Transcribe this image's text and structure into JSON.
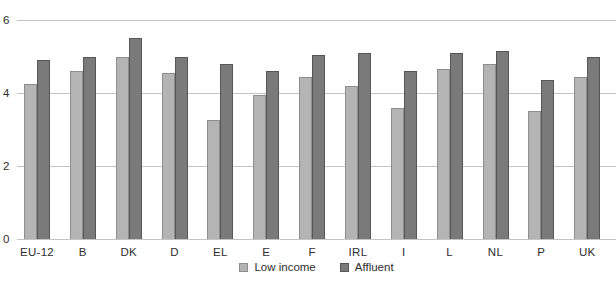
{
  "chart_data": {
    "type": "bar",
    "title": "",
    "xlabel": "",
    "ylabel": "",
    "ylim": [
      0,
      6
    ],
    "yticks": [
      0,
      2,
      4,
      6
    ],
    "grid": true,
    "legend_position": "bottom-center",
    "background_color": "#ffffff",
    "gridline_color": "#c4c4c4",
    "text_color": "#2e2e2e",
    "categories": [
      "EU-12",
      "B",
      "DK",
      "D",
      "EL",
      "E",
      "F",
      "IRL",
      "I",
      "L",
      "NL",
      "P",
      "UK"
    ],
    "series": [
      {
        "name": "Low income",
        "color": "#b4b4b4",
        "border_color": "#8e8e8e",
        "values": [
          4.25,
          4.6,
          5.0,
          4.55,
          3.25,
          3.95,
          4.45,
          4.2,
          3.6,
          4.65,
          4.8,
          3.5,
          4.45
        ]
      },
      {
        "name": "Affluent",
        "color": "#7a7a7a",
        "border_color": "#565656",
        "values": [
          4.9,
          5.0,
          5.5,
          5.0,
          4.8,
          4.6,
          5.05,
          5.1,
          4.6,
          5.1,
          5.15,
          4.35,
          5.0
        ]
      }
    ]
  }
}
